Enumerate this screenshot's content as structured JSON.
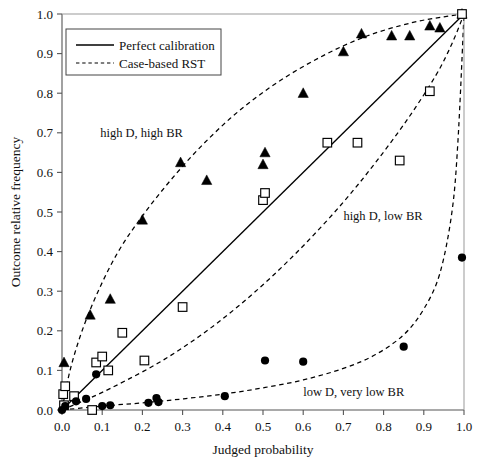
{
  "chart_data": {
    "type": "scatter",
    "title": "",
    "xlabel": "Judged probability",
    "ylabel": "Outcome relative frequency",
    "xlim": [
      0.0,
      1.0
    ],
    "ylim": [
      0.0,
      1.0
    ],
    "grid": false,
    "xticks": [
      "0.0",
      "0.1",
      "0.2",
      "0.3",
      "0.4",
      "0.5",
      "0.6",
      "0.7",
      "0.8",
      "0.9",
      "1.0"
    ],
    "yticks": [
      "0.0",
      "0.1",
      "0.2",
      "0.3",
      "0.4",
      "0.5",
      "0.6",
      "0.7",
      "0.8",
      "0.9",
      "1.0"
    ],
    "xtick_values": [
      0.0,
      0.1,
      0.2,
      0.3,
      0.4,
      0.5,
      0.6,
      0.7,
      0.8,
      0.9,
      1.0
    ],
    "ytick_values": [
      0.0,
      0.1,
      0.2,
      0.3,
      0.4,
      0.5,
      0.6,
      0.7,
      0.8,
      0.9,
      1.0
    ],
    "legend": {
      "position": "top-left-inside",
      "entries": [
        {
          "label": "Perfect calibration",
          "style": "solid"
        },
        {
          "label": "Case-based RST",
          "style": "dashed"
        }
      ]
    },
    "annotations": [
      {
        "text": "high D, high BR",
        "x": 0.095,
        "y": 0.69
      },
      {
        "text": "high D, low BR",
        "x": 0.7,
        "y": 0.48
      },
      {
        "text": "low D, very low BR",
        "x": 0.6,
        "y": 0.035
      }
    ],
    "series": [
      {
        "name": "high D, high BR",
        "marker": "filled-triangle",
        "color": "#000000",
        "points": [
          [
            0.005,
            0.12
          ],
          [
            0.07,
            0.24
          ],
          [
            0.12,
            0.28
          ],
          [
            0.2,
            0.48
          ],
          [
            0.295,
            0.625
          ],
          [
            0.36,
            0.58
          ],
          [
            0.5,
            0.62
          ],
          [
            0.505,
            0.65
          ],
          [
            0.6,
            0.8
          ],
          [
            0.7,
            0.905
          ],
          [
            0.745,
            0.95
          ],
          [
            0.82,
            0.945
          ],
          [
            0.865,
            0.945
          ],
          [
            0.915,
            0.97
          ],
          [
            0.94,
            0.965
          ],
          [
            0.995,
            1.0
          ]
        ]
      },
      {
        "name": "high D, low BR",
        "marker": "open-square",
        "color": "#000000",
        "points": [
          [
            0.003,
            0.04
          ],
          [
            0.005,
            0.012
          ],
          [
            0.008,
            0.06
          ],
          [
            0.03,
            0.035
          ],
          [
            0.075,
            0.0
          ],
          [
            0.085,
            0.12
          ],
          [
            0.1,
            0.135
          ],
          [
            0.115,
            0.1
          ],
          [
            0.15,
            0.195
          ],
          [
            0.205,
            0.125
          ],
          [
            0.3,
            0.26
          ],
          [
            0.5,
            0.53
          ],
          [
            0.505,
            0.548
          ],
          [
            0.66,
            0.675
          ],
          [
            0.735,
            0.675
          ],
          [
            0.84,
            0.63
          ],
          [
            0.915,
            0.805
          ],
          [
            0.995,
            1.0
          ]
        ]
      },
      {
        "name": "low D, very low BR",
        "marker": "filled-circle",
        "color": "#000000",
        "points": [
          [
            0.0,
            0.0
          ],
          [
            0.008,
            0.01
          ],
          [
            0.035,
            0.022
          ],
          [
            0.06,
            0.028
          ],
          [
            0.085,
            0.09
          ],
          [
            0.1,
            0.01
          ],
          [
            0.12,
            0.012
          ],
          [
            0.215,
            0.018
          ],
          [
            0.235,
            0.03
          ],
          [
            0.24,
            0.02
          ],
          [
            0.405,
            0.035
          ],
          [
            0.505,
            0.125
          ],
          [
            0.6,
            0.122
          ],
          [
            0.85,
            0.16
          ],
          [
            0.995,
            0.385
          ]
        ]
      }
    ],
    "curves": [
      {
        "name": "perfect-calibration",
        "style": "solid",
        "points": [
          [
            0.0,
            0.0
          ],
          [
            1.0,
            1.0
          ]
        ]
      },
      {
        "name": "rst-high-d-high-br",
        "style": "dashed",
        "points": [
          [
            0.0,
            0.0
          ],
          [
            0.02,
            0.1
          ],
          [
            0.05,
            0.2
          ],
          [
            0.09,
            0.3
          ],
          [
            0.14,
            0.4
          ],
          [
            0.2,
            0.49
          ],
          [
            0.27,
            0.58
          ],
          [
            0.35,
            0.67
          ],
          [
            0.44,
            0.755
          ],
          [
            0.54,
            0.83
          ],
          [
            0.65,
            0.895
          ],
          [
            0.76,
            0.945
          ],
          [
            0.87,
            0.978
          ],
          [
            0.95,
            0.993
          ],
          [
            1.0,
            1.0
          ]
        ]
      },
      {
        "name": "rst-high-d-low-br",
        "style": "dashed",
        "points": [
          [
            0.0,
            0.0
          ],
          [
            0.08,
            0.035
          ],
          [
            0.16,
            0.075
          ],
          [
            0.25,
            0.125
          ],
          [
            0.34,
            0.185
          ],
          [
            0.43,
            0.255
          ],
          [
            0.52,
            0.335
          ],
          [
            0.61,
            0.425
          ],
          [
            0.7,
            0.525
          ],
          [
            0.78,
            0.625
          ],
          [
            0.86,
            0.735
          ],
          [
            0.93,
            0.845
          ],
          [
            0.97,
            0.925
          ],
          [
            1.0,
            1.0
          ]
        ]
      },
      {
        "name": "rst-low-d-very-low-br",
        "style": "dashed",
        "points": [
          [
            0.0,
            0.0
          ],
          [
            0.1,
            0.01
          ],
          [
            0.2,
            0.018
          ],
          [
            0.3,
            0.028
          ],
          [
            0.4,
            0.04
          ],
          [
            0.5,
            0.056
          ],
          [
            0.6,
            0.076
          ],
          [
            0.7,
            0.105
          ],
          [
            0.78,
            0.14
          ],
          [
            0.85,
            0.19
          ],
          [
            0.9,
            0.255
          ],
          [
            0.94,
            0.345
          ],
          [
            0.97,
            0.5
          ],
          [
            0.985,
            0.68
          ],
          [
            1.0,
            1.0
          ]
        ]
      }
    ]
  }
}
